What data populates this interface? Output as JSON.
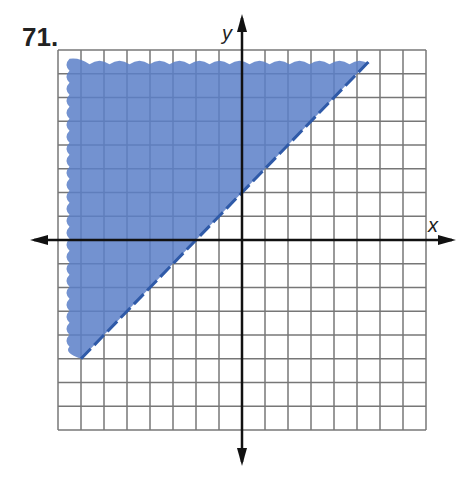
{
  "problem_number": "71.",
  "colors": {
    "shade": "#5b7fc8",
    "line": "#2f5aa8",
    "grid": "#777777",
    "axis": "#111111"
  },
  "chart_data": {
    "type": "area",
    "title": "71.",
    "xlabel": "x",
    "ylabel": "y",
    "xlim": [
      -8,
      8
    ],
    "ylim": [
      -8,
      8
    ],
    "grid": true,
    "grid_step": 1,
    "boundary_line": {
      "equation": "y = x + 2",
      "style": "dashed",
      "slope": 1,
      "y_intercept": 2,
      "x_intercept": -2,
      "from": [
        -7,
        -5
      ],
      "to": [
        5.5,
        7.5
      ]
    },
    "shaded_region": "y > x + 2 (above the line)",
    "inequality": "y > x + 2"
  }
}
